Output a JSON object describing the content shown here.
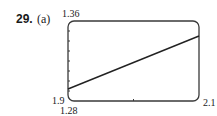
{
  "problem": {
    "number": "29.",
    "part": "(a)"
  },
  "window": {
    "xmin_label": "1.9",
    "xmax_label": "2.1",
    "ymin_label": "1.28",
    "ymax_label": "1.36"
  },
  "colors": {
    "frame": "#3a3a3a",
    "line": "#222222",
    "text": "#1a1a1a"
  },
  "chart_data": {
    "type": "line",
    "xlabel": "",
    "ylabel": "",
    "xlim": [
      1.9,
      2.1
    ],
    "ylim": [
      1.28,
      1.36
    ],
    "x_tick_step": 0.1,
    "y_tick_step": 0.01,
    "grid": false,
    "legend": null,
    "annotations": [
      "1.36",
      "1.9",
      "1.28",
      "2.1"
    ],
    "series": [
      {
        "name": "graph",
        "x": [
          1.9,
          2.1
        ],
        "y": [
          1.292,
          1.345
        ]
      }
    ]
  }
}
